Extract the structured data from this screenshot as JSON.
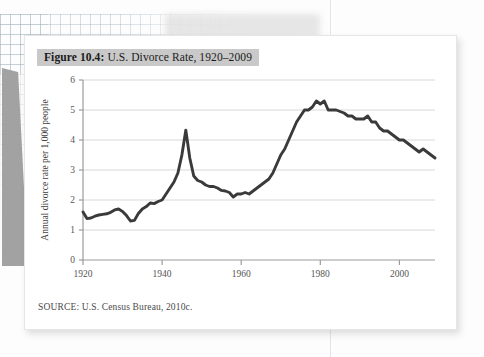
{
  "figure": {
    "caption_number": "Figure 10.4:",
    "caption_text": " U.S. Divorce Rate, 1920–2009",
    "source": "SOURCE: U.S. Census Bureau, 2010c.",
    "caption_highlight_color": "#c9c9c9",
    "card_background": "#ffffff"
  },
  "chart_data": {
    "type": "line",
    "title": "Figure 10.4: U.S. Divorce Rate, 1920–2009",
    "xlabel": "",
    "ylabel": "Annual divorce rate per 1,000 people",
    "xlim": [
      1920,
      2009
    ],
    "ylim": [
      0,
      6
    ],
    "xticks": [
      1920,
      1940,
      1960,
      1980,
      2000
    ],
    "xtick_labels": [
      "1920",
      "1940",
      "1960",
      "1980",
      "2000"
    ],
    "yticks": [
      0,
      1,
      2,
      3,
      4,
      5,
      6
    ],
    "ytick_labels": [
      "0",
      "1",
      "2",
      "3",
      "4",
      "5",
      "6"
    ],
    "grid": "horizontal",
    "legend": "none",
    "line_color": "#3a3a3a",
    "series": [
      {
        "name": "Annual divorce rate per 1,000 people",
        "x": [
          1920,
          1921,
          1922,
          1923,
          1924,
          1925,
          1926,
          1927,
          1928,
          1929,
          1930,
          1931,
          1932,
          1933,
          1934,
          1935,
          1936,
          1937,
          1938,
          1939,
          1940,
          1941,
          1942,
          1943,
          1944,
          1945,
          1946,
          1947,
          1948,
          1949,
          1950,
          1951,
          1952,
          1953,
          1954,
          1955,
          1956,
          1957,
          1958,
          1959,
          1960,
          1961,
          1962,
          1963,
          1964,
          1965,
          1966,
          1967,
          1968,
          1969,
          1970,
          1971,
          1972,
          1973,
          1974,
          1975,
          1976,
          1977,
          1978,
          1979,
          1980,
          1981,
          1982,
          1983,
          1984,
          1985,
          1986,
          1987,
          1988,
          1989,
          1990,
          1991,
          1992,
          1993,
          1994,
          1995,
          1996,
          1997,
          1998,
          1999,
          2000,
          2001,
          2002,
          2003,
          2004,
          2005,
          2006,
          2007,
          2008,
          2009
        ],
        "values": [
          1.6,
          1.38,
          1.4,
          1.46,
          1.5,
          1.52,
          1.54,
          1.59,
          1.67,
          1.7,
          1.62,
          1.48,
          1.3,
          1.32,
          1.55,
          1.7,
          1.78,
          1.9,
          1.88,
          1.95,
          2.0,
          2.2,
          2.4,
          2.6,
          2.9,
          3.5,
          4.33,
          3.4,
          2.8,
          2.65,
          2.6,
          2.5,
          2.45,
          2.45,
          2.4,
          2.32,
          2.3,
          2.25,
          2.1,
          2.2,
          2.2,
          2.25,
          2.2,
          2.3,
          2.4,
          2.5,
          2.6,
          2.7,
          2.9,
          3.2,
          3.5,
          3.7,
          4.0,
          4.3,
          4.6,
          4.8,
          5.0,
          5.0,
          5.1,
          5.3,
          5.2,
          5.3,
          5.0,
          5.0,
          5.0,
          4.95,
          4.9,
          4.8,
          4.8,
          4.7,
          4.7,
          4.7,
          4.8,
          4.6,
          4.6,
          4.4,
          4.3,
          4.3,
          4.2,
          4.1,
          4.0,
          4.0,
          3.9,
          3.8,
          3.7,
          3.6,
          3.7,
          3.6,
          3.5,
          3.4
        ]
      }
    ]
  }
}
